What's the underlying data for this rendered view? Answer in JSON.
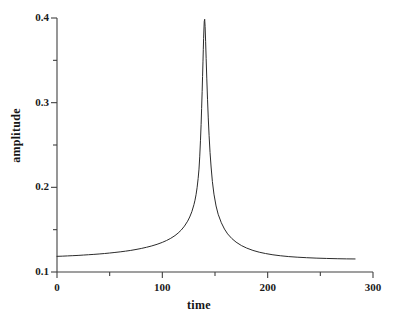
{
  "chart_data": {
    "type": "line",
    "title": "",
    "xlabel": "time",
    "ylabel": "amplitude",
    "xlim": [
      0,
      300
    ],
    "ylim": [
      0.1,
      0.4
    ],
    "grid": false,
    "legend": null,
    "x_ticks": [
      {
        "value": 0,
        "label": "0",
        "major": true
      },
      {
        "value": 50,
        "label": "",
        "major": false
      },
      {
        "value": 100,
        "label": "100",
        "major": true
      },
      {
        "value": 150,
        "label": "",
        "major": false
      },
      {
        "value": 200,
        "label": "200",
        "major": true
      },
      {
        "value": 250,
        "label": "",
        "major": false
      },
      {
        "value": 300,
        "label": "300",
        "major": true
      }
    ],
    "y_ticks": [
      {
        "value": 0.1,
        "label": "0.1",
        "major": true
      },
      {
        "value": 0.15,
        "label": "",
        "major": false
      },
      {
        "value": 0.2,
        "label": "0.2",
        "major": true
      },
      {
        "value": 0.25,
        "label": "",
        "major": false
      },
      {
        "value": 0.3,
        "label": "0.3",
        "major": true
      },
      {
        "value": 0.35,
        "label": "",
        "major": false
      },
      {
        "value": 0.4,
        "label": "0.4",
        "major": true
      }
    ],
    "line_color": "#2b2b2b",
    "line_width": 1,
    "series": [
      {
        "name": "amplitude",
        "peak_x": 139,
        "peak_y": 0.4,
        "baseline_y": 0.118,
        "x_start": 0,
        "x_end": 283,
        "x": [
          0,
          5,
          10,
          15,
          20,
          25,
          30,
          35,
          40,
          45,
          50,
          55,
          60,
          65,
          70,
          75,
          80,
          85,
          90,
          95,
          100,
          104,
          108,
          112,
          115,
          118,
          121,
          124,
          126,
          128,
          130,
          131,
          132,
          133,
          134,
          134.8,
          135.5,
          136.2,
          136.8,
          137.3,
          137.8,
          138.2,
          138.6,
          138.9,
          139.2,
          139.5,
          139.8,
          140.2,
          140.6,
          141.1,
          141.6,
          142.2,
          142.9,
          143.6,
          144.4,
          145.3,
          146.3,
          147.5,
          149,
          151,
          153,
          156,
          159,
          162,
          166,
          170,
          175,
          180,
          186,
          192,
          198,
          205,
          212,
          220,
          228,
          237,
          246,
          256,
          266,
          275,
          283
        ],
        "y": [
          0.1185,
          0.1187,
          0.119,
          0.1193,
          0.1196,
          0.12,
          0.1204,
          0.1208,
          0.1213,
          0.1218,
          0.1224,
          0.1231,
          0.1238,
          0.1246,
          0.1255,
          0.1266,
          0.1278,
          0.1292,
          0.1308,
          0.1327,
          0.135,
          0.1372,
          0.1398,
          0.143,
          0.146,
          0.1496,
          0.1542,
          0.16,
          0.165,
          0.1712,
          0.1795,
          0.1848,
          0.1912,
          0.1995,
          0.2105,
          0.2215,
          0.236,
          0.255,
          0.274,
          0.293,
          0.313,
          0.331,
          0.349,
          0.363,
          0.376,
          0.387,
          0.396,
          0.3985,
          0.39,
          0.372,
          0.352,
          0.329,
          0.304,
          0.282,
          0.261,
          0.241,
          0.224,
          0.207,
          0.192,
          0.178,
          0.1682,
          0.1582,
          0.1507,
          0.145,
          0.1395,
          0.1353,
          0.1313,
          0.1283,
          0.1255,
          0.1234,
          0.1218,
          0.1203,
          0.1192,
          0.1182,
          0.1175,
          0.1169,
          0.1164,
          0.116,
          0.1157,
          0.1155,
          0.1154
        ]
      }
    ]
  },
  "axes": {
    "x_axis_name": "time-axis",
    "y_axis_name": "amplitude-axis"
  }
}
